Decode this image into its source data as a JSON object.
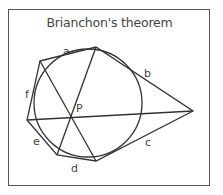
{
  "title": "Brianchon's theorem",
  "labels": {
    "a": "a",
    "b": "b",
    "c": "c",
    "d": "d",
    "e": "e",
    "f": "f",
    "p": "P"
  },
  "colors": {
    "stroke": "#333333",
    "text": "#444444",
    "border": "#555555"
  },
  "geometry": {
    "circle": {
      "cx": 88,
      "cy": 103,
      "r": 54
    },
    "hexagon_vertices": [
      [
        40,
        61
      ],
      [
        96,
        47
      ],
      [
        193,
        111
      ],
      [
        96,
        161
      ],
      [
        57,
        155
      ],
      [
        27,
        120
      ]
    ],
    "intersection_point": [
      71,
      119
    ]
  }
}
